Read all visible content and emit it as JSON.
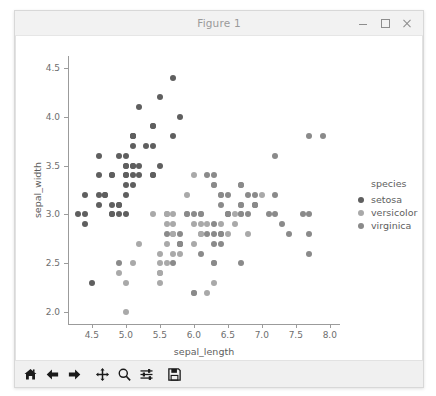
{
  "window": {
    "title": "Figure 1",
    "controls": [
      {
        "name": "minimize-button",
        "glyph": "minimize"
      },
      {
        "name": "maximize-button",
        "glyph": "maximize"
      },
      {
        "name": "close-button",
        "glyph": "close"
      }
    ]
  },
  "toolbar": {
    "buttons": [
      {
        "name": "home-button",
        "icon": "home-icon",
        "tooltip": "Home"
      },
      {
        "name": "back-button",
        "icon": "arrow-left-icon",
        "tooltip": "Back"
      },
      {
        "name": "forward-button",
        "icon": "arrow-right-icon",
        "tooltip": "Forward"
      },
      {
        "name": "pan-button",
        "icon": "move-icon",
        "tooltip": "Pan"
      },
      {
        "name": "zoom-button",
        "icon": "magnifier-icon",
        "tooltip": "Zoom"
      },
      {
        "name": "subplots-button",
        "icon": "sliders-icon",
        "tooltip": "Configure subplots"
      },
      {
        "name": "save-button",
        "icon": "floppy-disk-icon",
        "tooltip": "Save"
      }
    ]
  },
  "chart_data": {
    "type": "scatter",
    "title": "",
    "xlabel": "sepal_length",
    "ylabel": "sepal_width",
    "xlim": [
      4.15,
      8.15
    ],
    "ylim": [
      1.88,
      4.62
    ],
    "xticks": [
      4.5,
      5.0,
      5.5,
      6.0,
      6.5,
      7.0,
      7.5,
      8.0
    ],
    "xticklabels": [
      "4.5",
      "5.0",
      "5.5",
      "6.0",
      "6.5",
      "7.0",
      "7.5",
      "8.0"
    ],
    "yticks": [
      2.0,
      2.5,
      3.0,
      3.5,
      4.0,
      4.5
    ],
    "yticklabels": [
      "2.0",
      "2.5",
      "3.0",
      "3.5",
      "4.0",
      "4.5"
    ],
    "grid": false,
    "legend": {
      "title": "species",
      "position": "right-outside",
      "entries": [
        {
          "label": "setosa",
          "color": "#5f5f5f"
        },
        {
          "label": "versicolor",
          "color": "#a9a9a9"
        },
        {
          "label": "virginica",
          "color": "#8a8a8a"
        }
      ]
    },
    "marker_size_px": 6,
    "series": [
      {
        "name": "setosa",
        "color": "#5f5f5f",
        "points": [
          [
            5.1,
            3.5
          ],
          [
            4.9,
            3.0
          ],
          [
            4.7,
            3.2
          ],
          [
            4.6,
            3.1
          ],
          [
            5.0,
            3.6
          ],
          [
            5.4,
            3.9
          ],
          [
            4.6,
            3.4
          ],
          [
            5.0,
            3.4
          ],
          [
            4.4,
            2.9
          ],
          [
            4.9,
            3.1
          ],
          [
            5.4,
            3.7
          ],
          [
            4.8,
            3.4
          ],
          [
            4.8,
            3.0
          ],
          [
            4.3,
            3.0
          ],
          [
            5.8,
            4.0
          ],
          [
            5.7,
            4.4
          ],
          [
            5.4,
            3.9
          ],
          [
            5.1,
            3.5
          ],
          [
            5.7,
            3.8
          ],
          [
            5.1,
            3.8
          ],
          [
            5.4,
            3.4
          ],
          [
            5.1,
            3.7
          ],
          [
            4.6,
            3.6
          ],
          [
            5.1,
            3.3
          ],
          [
            4.8,
            3.4
          ],
          [
            5.0,
            3.0
          ],
          [
            5.0,
            3.4
          ],
          [
            5.2,
            3.5
          ],
          [
            5.2,
            3.4
          ],
          [
            4.7,
            3.2
          ],
          [
            4.8,
            3.1
          ],
          [
            5.4,
            3.4
          ],
          [
            5.2,
            4.1
          ],
          [
            5.5,
            4.2
          ],
          [
            4.9,
            3.1
          ],
          [
            5.0,
            3.2
          ],
          [
            5.5,
            3.5
          ],
          [
            4.9,
            3.6
          ],
          [
            4.4,
            3.0
          ],
          [
            5.1,
            3.4
          ],
          [
            5.0,
            3.5
          ],
          [
            4.5,
            2.3
          ],
          [
            4.4,
            3.2
          ],
          [
            5.0,
            3.5
          ],
          [
            5.1,
            3.8
          ],
          [
            4.8,
            3.0
          ],
          [
            5.1,
            3.8
          ],
          [
            4.6,
            3.2
          ],
          [
            5.3,
            3.7
          ],
          [
            5.0,
            3.3
          ]
        ]
      },
      {
        "name": "versicolor",
        "color": "#a9a9a9",
        "points": [
          [
            7.0,
            3.2
          ],
          [
            6.4,
            3.2
          ],
          [
            6.9,
            3.1
          ],
          [
            5.5,
            2.3
          ],
          [
            6.5,
            2.8
          ],
          [
            5.7,
            2.8
          ],
          [
            6.3,
            3.3
          ],
          [
            4.9,
            2.4
          ],
          [
            6.6,
            2.9
          ],
          [
            5.2,
            2.7
          ],
          [
            5.0,
            2.0
          ],
          [
            5.9,
            3.0
          ],
          [
            6.0,
            2.2
          ],
          [
            6.1,
            2.9
          ],
          [
            5.6,
            2.9
          ],
          [
            6.7,
            3.1
          ],
          [
            5.6,
            3.0
          ],
          [
            5.8,
            2.7
          ],
          [
            6.2,
            2.2
          ],
          [
            5.6,
            2.5
          ],
          [
            5.9,
            3.2
          ],
          [
            6.1,
            2.8
          ],
          [
            6.3,
            2.5
          ],
          [
            6.1,
            2.8
          ],
          [
            6.4,
            2.9
          ],
          [
            6.6,
            3.0
          ],
          [
            6.8,
            2.8
          ],
          [
            6.7,
            3.0
          ],
          [
            6.0,
            2.9
          ],
          [
            5.7,
            2.6
          ],
          [
            5.5,
            2.4
          ],
          [
            5.5,
            2.4
          ],
          [
            5.8,
            2.7
          ],
          [
            6.0,
            2.7
          ],
          [
            5.4,
            3.0
          ],
          [
            6.0,
            3.4
          ],
          [
            6.7,
            3.1
          ],
          [
            6.3,
            2.3
          ],
          [
            5.6,
            3.0
          ],
          [
            5.5,
            2.5
          ],
          [
            5.5,
            2.6
          ],
          [
            6.1,
            3.0
          ],
          [
            5.8,
            2.6
          ],
          [
            5.0,
            2.3
          ],
          [
            5.6,
            2.7
          ],
          [
            5.7,
            3.0
          ],
          [
            5.7,
            2.9
          ],
          [
            6.2,
            2.9
          ],
          [
            5.1,
            2.5
          ],
          [
            5.7,
            2.8
          ]
        ]
      },
      {
        "name": "virginica",
        "color": "#8a8a8a",
        "points": [
          [
            6.3,
            3.3
          ],
          [
            5.8,
            2.7
          ],
          [
            7.1,
            3.0
          ],
          [
            6.3,
            2.9
          ],
          [
            6.5,
            3.0
          ],
          [
            7.6,
            3.0
          ],
          [
            4.9,
            2.5
          ],
          [
            7.3,
            2.9
          ],
          [
            6.7,
            2.5
          ],
          [
            7.2,
            3.6
          ],
          [
            6.5,
            3.2
          ],
          [
            6.4,
            2.7
          ],
          [
            6.8,
            3.0
          ],
          [
            5.7,
            2.5
          ],
          [
            5.8,
            2.8
          ],
          [
            6.4,
            3.2
          ],
          [
            6.5,
            3.0
          ],
          [
            7.7,
            3.8
          ],
          [
            7.7,
            2.6
          ],
          [
            6.0,
            2.2
          ],
          [
            6.9,
            3.2
          ],
          [
            5.6,
            2.8
          ],
          [
            7.7,
            2.8
          ],
          [
            6.3,
            2.7
          ],
          [
            6.7,
            3.3
          ],
          [
            7.2,
            3.2
          ],
          [
            6.2,
            2.8
          ],
          [
            6.1,
            3.0
          ],
          [
            6.4,
            2.8
          ],
          [
            7.2,
            3.0
          ],
          [
            7.4,
            2.8
          ],
          [
            7.9,
            3.8
          ],
          [
            6.4,
            2.8
          ],
          [
            6.3,
            2.8
          ],
          [
            6.1,
            2.6
          ],
          [
            7.7,
            3.0
          ],
          [
            6.3,
            3.4
          ],
          [
            6.4,
            3.1
          ],
          [
            6.0,
            3.0
          ],
          [
            6.9,
            3.1
          ],
          [
            6.7,
            3.1
          ],
          [
            6.9,
            3.1
          ],
          [
            5.8,
            2.7
          ],
          [
            6.8,
            3.2
          ],
          [
            6.7,
            3.3
          ],
          [
            6.7,
            3.0
          ],
          [
            6.3,
            2.5
          ],
          [
            6.5,
            3.0
          ],
          [
            6.2,
            3.4
          ],
          [
            5.9,
            3.0
          ]
        ]
      }
    ]
  }
}
